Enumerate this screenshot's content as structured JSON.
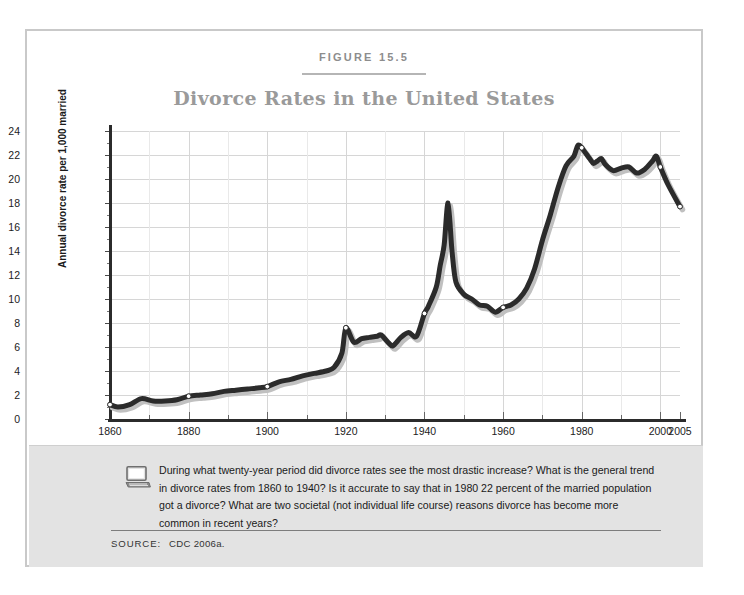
{
  "figure": {
    "label": "FIGURE 15.5",
    "title": "Divorce Rates in the United States",
    "source_key": "SOURCE:",
    "source_value": "CDC 2006a.",
    "icon": "computer-monitor-icon",
    "question": "During what twenty-year period did divorce rates see the most drastic increase? What is the general trend in divorce rates from 1860 to 1940? Is it accurate to say that in 1980 22 percent of the married population got a divorce? What are two societal (not individual life course) reasons divorce has become more common in recent years?"
  },
  "colors": {
    "line": "#2b2b2b",
    "line_shadow": "#c0c0c0",
    "marker_fill": "#ffffff",
    "grid": "#d6d6d6",
    "axis": "#2b2b2b",
    "title": "#9a9a9a",
    "figure_label": "#8d8d8d",
    "caption_background": "#e3e3e3",
    "card_border": "#c9c9c9",
    "page_background": "#ffffff"
  },
  "chart_data": {
    "type": "line",
    "title": "Divorce Rates in the United States",
    "xlabel": "",
    "ylabel": "Annual divorce rate per 1,000 married",
    "xlim": [
      1860,
      2005
    ],
    "ylim": [
      0,
      24
    ],
    "grid": true,
    "legend": "none",
    "ytick_labels": [
      "0",
      "2",
      "4",
      "6",
      "8",
      "10",
      "12",
      "14",
      "16",
      "18",
      "20",
      "22",
      "24"
    ],
    "yticks": [
      0,
      2,
      4,
      6,
      8,
      10,
      12,
      14,
      16,
      18,
      20,
      22,
      24
    ],
    "xtick_labels": [
      "1860",
      "1880",
      "1900",
      "1920",
      "1940",
      "1960",
      "1980",
      "2000",
      "2005"
    ],
    "xticks": [
      1860,
      1880,
      1900,
      1920,
      1940,
      1960,
      1980,
      2000,
      2005
    ],
    "marker_years": [
      1860,
      1880,
      1900,
      1920,
      1940,
      1960,
      1980,
      2000,
      2005
    ],
    "x": [
      1860,
      1864,
      1867,
      1870,
      1874,
      1878,
      1880,
      1884,
      1888,
      1890,
      1894,
      1898,
      1900,
      1904,
      1908,
      1910,
      1914,
      1918,
      1920,
      1922,
      1924,
      1926,
      1928,
      1929,
      1932,
      1934,
      1936,
      1938,
      1940,
      1942,
      1944,
      1946,
      1948,
      1950,
      1953,
      1956,
      1958,
      1960,
      1962,
      1965,
      1968,
      1970,
      1972,
      1974,
      1976,
      1978,
      1980,
      1982,
      1984,
      1986,
      1988,
      1990,
      1992,
      1995,
      1998,
      2000,
      2005
    ],
    "y": [
      1.2,
      1.0,
      1.5,
      1.4,
      1.4,
      1.5,
      1.9,
      2.0,
      2.2,
      2.3,
      2.6,
      2.7,
      3.0,
      3.3,
      3.4,
      3.6,
      3.7,
      4.0,
      4.3,
      4.6,
      5.3,
      5.6,
      6.2,
      6.3,
      6.6,
      6.1,
      6.4,
      6.9,
      7.6,
      7.5,
      7.3,
      7.2,
      6.8,
      6.6,
      6.2,
      6.1,
      6.4,
      6.9,
      7.7,
      8.0,
      8.6,
      8.8,
      8.7,
      7.6,
      7.2,
      7.0,
      7.8,
      10.0,
      13.0,
      16.0,
      18.0,
      14.0,
      10.3,
      9.5,
      9.3,
      9.4,
      9.2
    ],
    "series": [
      {
        "name": "Annual divorce rate per 1,000 married",
        "points": [
          [
            1860,
            1.2
          ],
          [
            1862,
            1.0
          ],
          [
            1865,
            1.2
          ],
          [
            1868,
            1.7
          ],
          [
            1871,
            1.5
          ],
          [
            1874,
            1.5
          ],
          [
            1877,
            1.6
          ],
          [
            1880,
            1.9
          ],
          [
            1883,
            2.0
          ],
          [
            1886,
            2.1
          ],
          [
            1889,
            2.3
          ],
          [
            1892,
            2.4
          ],
          [
            1895,
            2.5
          ],
          [
            1898,
            2.6
          ],
          [
            1900,
            2.7
          ],
          [
            1903,
            3.1
          ],
          [
            1906,
            3.3
          ],
          [
            1909,
            3.6
          ],
          [
            1912,
            3.8
          ],
          [
            1915,
            4.0
          ],
          [
            1917,
            4.3
          ],
          [
            1919,
            5.5
          ],
          [
            1920,
            7.6
          ],
          [
            1922,
            6.4
          ],
          [
            1924,
            6.7
          ],
          [
            1926,
            6.8
          ],
          [
            1928,
            6.9
          ],
          [
            1929,
            7.0
          ],
          [
            1931,
            6.3
          ],
          [
            1932,
            6.1
          ],
          [
            1934,
            6.8
          ],
          [
            1936,
            7.2
          ],
          [
            1938,
            6.9
          ],
          [
            1940,
            8.8
          ],
          [
            1941,
            9.4
          ],
          [
            1943,
            11.0
          ],
          [
            1944,
            12.8
          ],
          [
            1945,
            14.5
          ],
          [
            1946,
            18.0
          ],
          [
            1947,
            14.0
          ],
          [
            1948,
            11.4
          ],
          [
            1950,
            10.4
          ],
          [
            1952,
            10.0
          ],
          [
            1954,
            9.5
          ],
          [
            1956,
            9.4
          ],
          [
            1958,
            8.9
          ],
          [
            1960,
            9.3
          ],
          [
            1962,
            9.5
          ],
          [
            1964,
            10.0
          ],
          [
            1966,
            10.9
          ],
          [
            1968,
            12.5
          ],
          [
            1970,
            14.9
          ],
          [
            1972,
            17.0
          ],
          [
            1974,
            19.3
          ],
          [
            1976,
            21.1
          ],
          [
            1978,
            21.9
          ],
          [
            1979,
            22.8
          ],
          [
            1980,
            22.6
          ],
          [
            1982,
            21.7
          ],
          [
            1983,
            21.3
          ],
          [
            1984,
            21.5
          ],
          [
            1985,
            21.7
          ],
          [
            1986,
            21.2
          ],
          [
            1988,
            20.7
          ],
          [
            1990,
            20.9
          ],
          [
            1992,
            21.0
          ],
          [
            1994,
            20.5
          ],
          [
            1996,
            20.8
          ],
          [
            1998,
            21.5
          ],
          [
            1999,
            21.9
          ],
          [
            2000,
            21.0
          ],
          [
            2002,
            19.5
          ],
          [
            2005,
            17.7
          ]
        ]
      }
    ],
    "annotations": [
      {
        "label": "post-WWII peak",
        "year": 1946,
        "value": 18.0
      },
      {
        "label": "1980 peak",
        "year": 1980,
        "value": 22.6
      },
      {
        "label": "series start",
        "year": 1860,
        "value": 1.2
      },
      {
        "label": "series end",
        "year": 2005,
        "value": 17.7
      }
    ]
  }
}
